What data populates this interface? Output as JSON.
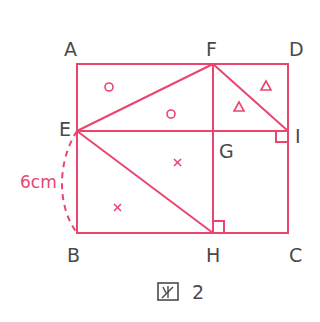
{
  "figure": {
    "caption_box_glyph": "図",
    "caption_number": "2",
    "stroke_color": "#e8466e",
    "label_color": "#4a4a4a",
    "points": {
      "A": "A",
      "F": "F",
      "D": "D",
      "E": "E",
      "G": "G",
      "I": "I",
      "B": "B",
      "H": "H",
      "C": "C"
    },
    "measurement": "6cm",
    "marks": {
      "circle": "○",
      "triangle": "△",
      "cross": "×"
    }
  }
}
